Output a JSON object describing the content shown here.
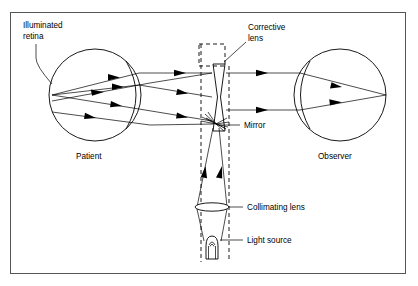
{
  "figure": {
    "background_color": "#ffffff",
    "ink_color": "#000000",
    "frame_color": "#555555",
    "labels": {
      "illuminated_retina_line1": "Illuminated",
      "illuminated_retina_line2": "retina",
      "corrective_lens_line1": "Corrective",
      "corrective_lens_line2": "lens",
      "patient": "Patient",
      "observer": "Observer",
      "mirror": "Mirror",
      "collimating_lens": "Collimating lens",
      "light_source": "Light source"
    },
    "components": [
      {
        "name": "patient-eye",
        "shape": "circle",
        "cx": 95,
        "cy": 95,
        "r": 46
      },
      {
        "name": "observer-eye",
        "shape": "circle",
        "cx": 340,
        "cy": 95,
        "r": 46
      },
      {
        "name": "corrective-lens",
        "shape": "biconcave-lens",
        "cx": 219,
        "cy": 97
      },
      {
        "name": "mirror",
        "shape": "angled-hatched-mirror",
        "cx": 216,
        "cy": 124
      },
      {
        "name": "collimating-lens",
        "shape": "ellipse-lens",
        "cx": 212,
        "cy": 207
      },
      {
        "name": "light-source",
        "shape": "bulb",
        "cx": 212,
        "cy": 243
      },
      {
        "name": "alignment-box",
        "shape": "dashed-rectangle",
        "x": 199,
        "y": 44,
        "w": 26,
        "h": 22
      },
      {
        "name": "optical-axis-left",
        "shape": "dashed-vertical",
        "x": 201,
        "y1": 42,
        "y2": 262
      },
      {
        "name": "optical-axis-right",
        "shape": "dashed-vertical",
        "x": 229,
        "y1": 42,
        "y2": 262
      }
    ],
    "ray_count": {
      "patient_to_lens": 3,
      "lens_to_observer": 2,
      "source_to_mirror": 2
    }
  }
}
